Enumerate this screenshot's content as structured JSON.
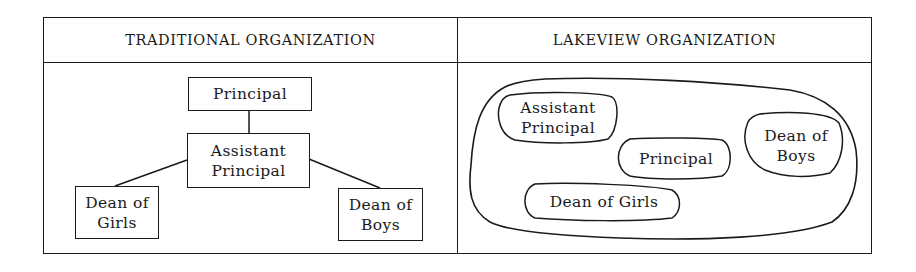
{
  "panels": {
    "left": {
      "title": "TRADITIONAL ORGANIZATION",
      "nodes": {
        "principal": "Principal",
        "assistant_principal": "Assistant\nPrincipal",
        "dean_of_girls": "Dean of\nGirls",
        "dean_of_boys": "Dean of\nBoys"
      },
      "edges": [
        [
          "Principal",
          "Assistant Principal"
        ],
        [
          "Assistant Principal",
          "Dean of Girls"
        ],
        [
          "Assistant Principal",
          "Dean of Boys"
        ]
      ]
    },
    "right": {
      "title": "LAKEVIEW ORGANIZATION",
      "nodes": {
        "assistant_principal": "Assistant\nPrincipal",
        "principal": "Principal",
        "dean_of_boys": "Dean of\nBoys",
        "dean_of_girls": "Dean of Girls"
      }
    }
  },
  "colors": {
    "ink": "#1a1a1a",
    "background": "#ffffff"
  }
}
